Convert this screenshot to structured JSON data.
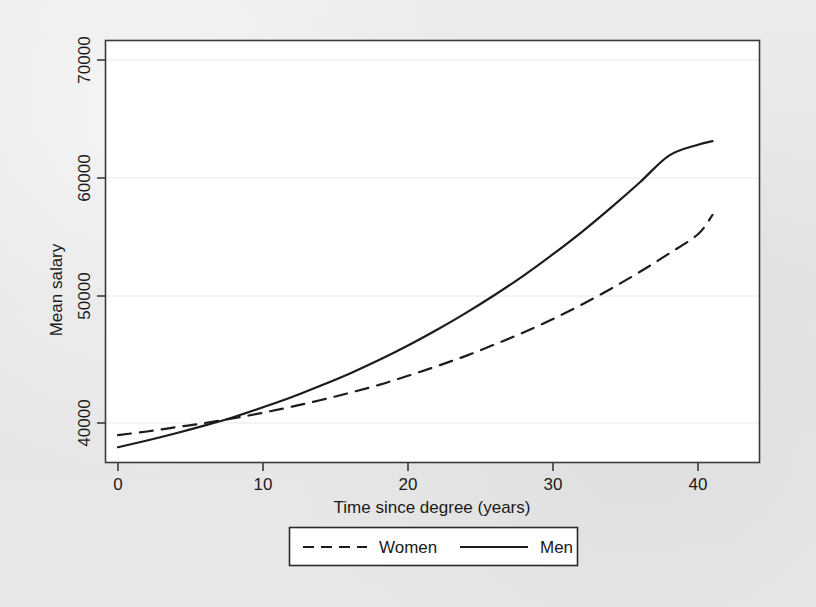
{
  "chart_data": {
    "type": "line",
    "title": "",
    "xlabel": "Time since degree (years)",
    "ylabel": "Mean salary",
    "xlim": [
      0,
      41
    ],
    "ylim": [
      36800,
      72000
    ],
    "xticks": [
      0,
      10,
      20,
      30,
      40
    ],
    "yticks": [
      40000,
      50000,
      60000,
      70000
    ],
    "xtick_labels": [
      "0",
      "10",
      "20",
      "30",
      "40"
    ],
    "ytick_labels": [
      "40000",
      "50000",
      "60000",
      "70000"
    ],
    "grid": "horizontal-faint",
    "legend_position": "below-axis-centered",
    "x": [
      0,
      2,
      4,
      6,
      8,
      10,
      12,
      14,
      16,
      18,
      20,
      22,
      24,
      26,
      28,
      30,
      32,
      34,
      36,
      38,
      40,
      41
    ],
    "series": [
      {
        "name": "Women",
        "style": "dashed",
        "color": "#1c1c1c",
        "values": [
          39000,
          39300,
          39650,
          40000,
          40400,
          40850,
          41350,
          41900,
          42500,
          43150,
          43900,
          44700,
          45550,
          46500,
          47500,
          48600,
          49800,
          51100,
          52500,
          54000,
          55600,
          57200
        ]
      },
      {
        "name": "Men",
        "style": "solid",
        "color": "#1c1c1c",
        "values": [
          38000,
          38550,
          39150,
          39800,
          40500,
          41300,
          42150,
          43100,
          44100,
          45200,
          46400,
          47700,
          49100,
          50600,
          52200,
          53950,
          55800,
          57800,
          59900,
          62100,
          63000,
          63300
        ]
      }
    ]
  },
  "legend": {
    "entries": [
      {
        "label": "Women",
        "style": "dashed"
      },
      {
        "label": "Men",
        "style": "solid"
      }
    ]
  },
  "axes": {
    "x_title": "Time since degree (years)",
    "y_title": "Mean salary"
  }
}
